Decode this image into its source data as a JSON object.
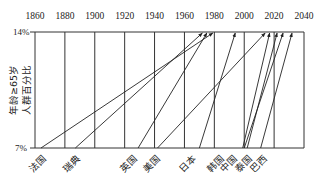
{
  "chart_data": {
    "type": "line",
    "title": "",
    "xlabel": "",
    "ylabel": "年龄≥65岁人群百分比",
    "ylabel_lines": [
      "年龄≥65岁",
      "人群百分比"
    ],
    "x_ticks": [
      1860,
      1880,
      1900,
      1920,
      1940,
      1960,
      1980,
      2000,
      2020,
      2040
    ],
    "x_range": [
      1860,
      2040
    ],
    "y_ticks": [
      "14%",
      "7%"
    ],
    "y_values": [
      14,
      7
    ],
    "grid": {
      "vertical": true,
      "horizontal": false
    },
    "legend": "none",
    "series": [
      {
        "name": "法国",
        "start_year": 1864,
        "end_year": 1979,
        "start_pct": 7,
        "end_pct": 14
      },
      {
        "name": "瑞典",
        "start_year": 1887,
        "end_year": 1972,
        "start_pct": 7,
        "end_pct": 14
      },
      {
        "name": "英国",
        "start_year": 1929,
        "end_year": 1975,
        "start_pct": 7,
        "end_pct": 14
      },
      {
        "name": "美国",
        "start_year": 1942,
        "end_year": 2014,
        "start_pct": 7,
        "end_pct": 14
      },
      {
        "name": "日本",
        "start_year": 1970,
        "end_year": 1994,
        "start_pct": 7,
        "end_pct": 14
      },
      {
        "name": "韩国",
        "start_year": 1999,
        "end_year": 2017,
        "start_pct": 7,
        "end_pct": 14
      },
      {
        "name": "中国",
        "start_year": 2000,
        "end_year": 2026,
        "start_pct": 7,
        "end_pct": 14
      },
      {
        "name": "泰国",
        "start_year": 2002,
        "end_year": 2022,
        "start_pct": 7,
        "end_pct": 14
      },
      {
        "name": "巴西",
        "start_year": 2011,
        "end_year": 2032,
        "start_pct": 7,
        "end_pct": 14
      }
    ],
    "category_labels": [
      "法国",
      "瑞典",
      "英国",
      "美国",
      "日本",
      "韩国",
      "中国",
      "泰国",
      "巴西"
    ]
  }
}
